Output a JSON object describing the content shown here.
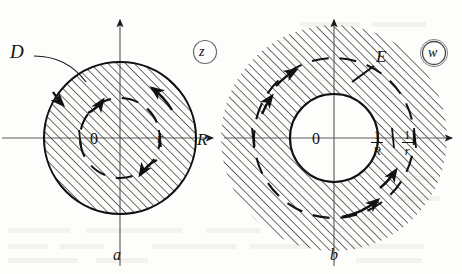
{
  "figure": {
    "caption_labels": {
      "left": "a",
      "right": "b"
    },
    "panels": [
      {
        "id": "z-plane",
        "plane_label": "z",
        "region_label": "D",
        "origin_label": "0",
        "axis_label_horizontal": "R",
        "inner_radius_label": "r",
        "sub_label": "a",
        "description": "Hatched filled disk of radius R with dashed circle of radius r and counterclockwise orientation arrows",
        "shaded": "disk-interior",
        "outer_radius_px": 76,
        "inner_radius_px": 40,
        "center_px": {
          "x": 120,
          "y": 138
        }
      },
      {
        "id": "w-plane",
        "plane_label": "w",
        "region_label": "E",
        "origin_label": "0",
        "axis_label_horizontal": "",
        "inner_radius_numerator": "1",
        "inner_radius_denominator": "R",
        "outer_radius_numerator": "1",
        "outer_radius_denominator": "r",
        "sub_label": "b",
        "description": "White inner disk of radius 1/R surrounded by hatched exterior region with dashed circle of radius 1/r and clockwise orientation arrows",
        "shaded": "disk-exterior",
        "inner_radius_px": 44,
        "dashed_radius_px": 80,
        "center_px": {
          "x": 334,
          "y": 138
        }
      }
    ]
  },
  "colors": {
    "ink": "#111111",
    "hatch": "#2b2b2b",
    "axis": "#5d5d5d",
    "background": "#fdfdfb",
    "paper_ghost": "#e8e6e0"
  },
  "icons": {
    "arrow_head": "axis-arrow-icon",
    "orientation_arrow": "orientation-arrow-icon"
  }
}
